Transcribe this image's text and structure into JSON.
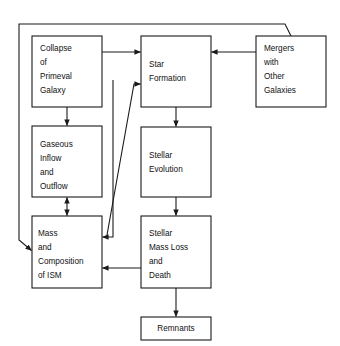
{
  "diagram": {
    "style": {
      "background": "#ffffff",
      "box_fill": "#ffffff",
      "box_stroke": "#1a1a1a",
      "text_color": "#111111",
      "arrow_color": "#1a1a1a"
    },
    "nodes": [
      {
        "id": "collapse",
        "label": "Collapse of Primeval Galaxy",
        "lines": [
          "Collapse",
          "of",
          "Primeval",
          "Galaxy"
        ],
        "x": 32,
        "y": 36,
        "w": 70,
        "h": 71
      },
      {
        "id": "star-formation",
        "label": "Star Formation",
        "lines": [
          "Star",
          "Formation"
        ],
        "x": 141,
        "y": 36,
        "w": 70,
        "h": 71
      },
      {
        "id": "mergers",
        "label": "Mergers with Other Galaxies",
        "lines": [
          "Mergers",
          "with",
          "Other",
          "Galaxies"
        ],
        "x": 256,
        "y": 36,
        "w": 70,
        "h": 71
      },
      {
        "id": "gaseous",
        "label": "Gaseous Inflow and Outflow",
        "lines": [
          "Gaseous",
          "Inflow",
          "and",
          "Outflow"
        ],
        "x": 32,
        "y": 126,
        "w": 70,
        "h": 71
      },
      {
        "id": "stellar-evolution",
        "label": "Stellar Evolution",
        "lines": [
          "Stellar",
          "Evolution"
        ],
        "x": 141,
        "y": 127,
        "w": 70,
        "h": 70
      },
      {
        "id": "mass-ism",
        "label": "Mass and Composition of ISM",
        "lines": [
          "Mass",
          "and",
          "Composition",
          "of ISM"
        ],
        "x": 32,
        "y": 216,
        "w": 70,
        "h": 72
      },
      {
        "id": "mass-loss",
        "label": "Stellar Mass Loss and Death",
        "lines": [
          "Stellar",
          "Mass Loss",
          "and",
          "Death"
        ],
        "x": 141,
        "y": 216,
        "w": 70,
        "h": 72
      },
      {
        "id": "remnants",
        "label": "Remnants",
        "lines": [
          "Remnants"
        ],
        "x": 141,
        "y": 317,
        "w": 70,
        "h": 23
      }
    ],
    "edges": [
      {
        "id": "collapse-to-star-formation",
        "from": "collapse",
        "to": "star-formation",
        "arrowheads": "end"
      },
      {
        "id": "mergers-to-star-formation",
        "from": "mergers",
        "to": "star-formation",
        "arrowheads": "end"
      },
      {
        "id": "collapse-to-gaseous",
        "from": "collapse",
        "to": "gaseous",
        "arrowheads": "end"
      },
      {
        "id": "gaseous-to-mass-ism",
        "from": "gaseous",
        "to": "mass-ism",
        "arrowheads": "both"
      },
      {
        "id": "star-formation-to-stellar-evolution",
        "from": "star-formation",
        "to": "stellar-evolution",
        "arrowheads": "end"
      },
      {
        "id": "stellar-evolution-to-mass-loss",
        "from": "stellar-evolution",
        "to": "mass-loss",
        "arrowheads": "end"
      },
      {
        "id": "mass-loss-to-mass-ism",
        "from": "mass-loss",
        "to": "mass-ism",
        "arrowheads": "end"
      },
      {
        "id": "mass-loss-to-remnants",
        "from": "mass-loss",
        "to": "remnants",
        "arrowheads": "end"
      },
      {
        "id": "mass-ism-to-star-formation",
        "from": "mass-ism",
        "to": "star-formation",
        "arrowheads": "end"
      },
      {
        "id": "star-formation-to-mass-ism",
        "from": "star-formation",
        "to": "mass-ism",
        "arrowheads": "end"
      },
      {
        "id": "mergers-feedback-to-mass-ism",
        "from": "mergers",
        "to": "mass-ism",
        "arrowheads": "end"
      }
    ]
  }
}
